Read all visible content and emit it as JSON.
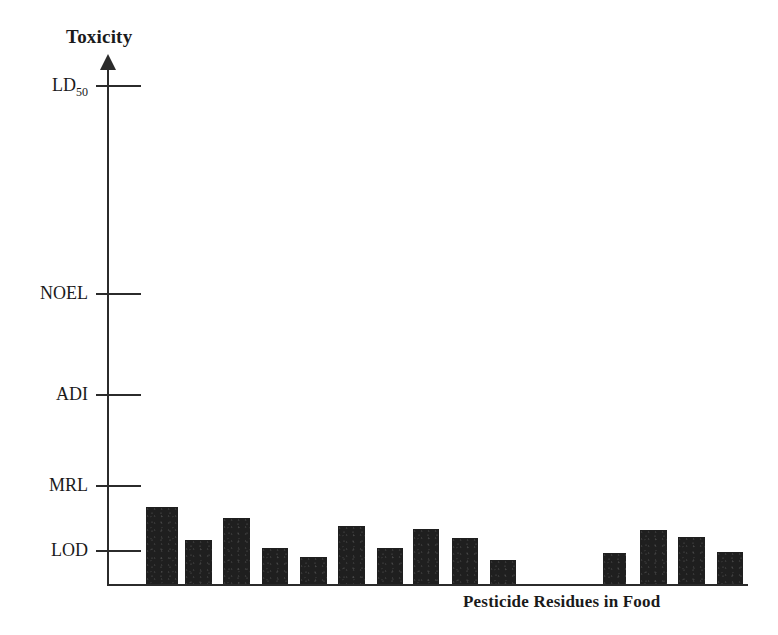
{
  "chart_data": {
    "type": "bar",
    "title": "",
    "ylabel": "Toxicity",
    "xlabel": "Pesticide Residues in Food",
    "grid": false,
    "legend": null,
    "y_axis": {
      "type": "ordinal-threshold",
      "tick_labels": [
        "LD50",
        "NOEL",
        "ADI",
        "MRL",
        "LOD"
      ],
      "tick_labels_display": [
        "LD₅₀",
        "NOEL",
        "ADI",
        "MRL",
        "LOD"
      ],
      "tick_positions_px": [
        85,
        293,
        394,
        485,
        550
      ],
      "direction": "increasing-upward",
      "note": "LD50 highest toxicity level, LOD lowest (limit of detection)"
    },
    "x_axis": {
      "tick_labels": [],
      "categories_count": 14
    },
    "categories": [
      "1",
      "2",
      "3",
      "4",
      "5",
      "6",
      "7",
      "8",
      "9",
      "10",
      "11",
      "12",
      "13",
      "14"
    ],
    "values_px_top": [
      507,
      540,
      518,
      548,
      557,
      526,
      548,
      529,
      538,
      560,
      553,
      530,
      537,
      552
    ],
    "values_relative_to_lod": [
      1.74,
      1.0,
      1.5,
      0.82,
      0.56,
      1.18,
      0.82,
      1.12,
      0.87,
      0.38,
      0.56,
      1.09,
      0.91,
      0.59
    ],
    "values_description": "All residue bars fall at or slightly above LOD, far below MRL, ADI, NOEL and LD50",
    "bar_color": "#1f1f1f",
    "axis_color": "#2b2b2b",
    "background_color": "#ffffff",
    "bars": [
      {
        "x": 146,
        "y": 507,
        "w": 32,
        "h": 77
      },
      {
        "x": 185,
        "y": 540,
        "w": 27,
        "h": 44
      },
      {
        "x": 223,
        "y": 518,
        "w": 27,
        "h": 66
      },
      {
        "x": 262,
        "y": 548,
        "w": 26,
        "h": 36
      },
      {
        "x": 300,
        "y": 557,
        "w": 27,
        "h": 27
      },
      {
        "x": 338,
        "y": 526,
        "w": 27,
        "h": 58
      },
      {
        "x": 377,
        "y": 548,
        "w": 26,
        "h": 36
      },
      {
        "x": 413,
        "y": 529,
        "w": 26,
        "h": 55
      },
      {
        "x": 452,
        "y": 538,
        "w": 26,
        "h": 46
      },
      {
        "x": 490,
        "y": 560,
        "w": 26,
        "h": 24
      },
      {
        "x": 603,
        "y": 553,
        "w": 23,
        "h": 31
      },
      {
        "x": 640,
        "y": 530,
        "w": 27,
        "h": 54
      },
      {
        "x": 678,
        "y": 537,
        "w": 27,
        "h": 47
      },
      {
        "x": 717,
        "y": 552,
        "w": 26,
        "h": 32
      }
    ]
  },
  "labels": {
    "y_axis_title": "Toxicity",
    "x_axis_title": "Pesticide Residues in Food",
    "tick_ld50_main": "LD",
    "tick_ld50_sub": "50",
    "tick_noel": "NOEL",
    "tick_adi": "ADI",
    "tick_mrl": "MRL",
    "tick_lod": "LOD"
  }
}
